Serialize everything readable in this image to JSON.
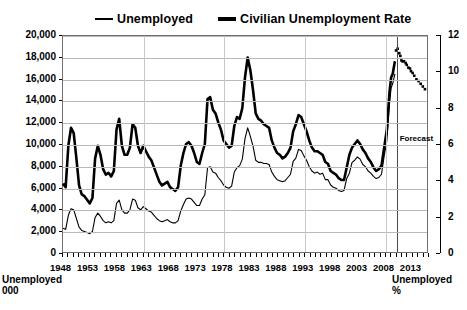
{
  "legend": {
    "items": [
      {
        "label": "Unemployed",
        "style": "thin-line",
        "x": 95
      },
      {
        "label": "Civilian Unemployment Rate",
        "style": "thick-line",
        "x": 218
      }
    ]
  },
  "annotations": {
    "forecast_label": "Forecast",
    "forecast_year": 2010
  },
  "axis_corner_labels": {
    "bottom_left_line1": "Unemployed",
    "bottom_left_line2": "000",
    "bottom_right_line1": "Unemployed",
    "bottom_right_line2": "%"
  },
  "chart_data": {
    "type": "line",
    "title": "",
    "xlabel": "",
    "ylabel": "Unemployed 000",
    "y2label": "Unemployed %",
    "grid": true,
    "legend_position": "top",
    "xlim": [
      1948,
      2016
    ],
    "ylim": [
      0,
      20000
    ],
    "y2lim": [
      0,
      12
    ],
    "yticks": [
      "0",
      "2,000",
      "4,000",
      "6,000",
      "8,000",
      "10,000",
      "12,000",
      "14,000",
      "16,000",
      "18,000",
      "20,000"
    ],
    "y2ticks": [
      "0",
      "2",
      "4",
      "6",
      "8",
      "10",
      "12"
    ],
    "xticks": [
      "1948",
      "1953",
      "1958",
      "1963",
      "1968",
      "1973",
      "1978",
      "1983",
      "1988",
      "1993",
      "1998",
      "2003",
      "2008",
      "2013"
    ],
    "series": [
      {
        "name": "Unemployed",
        "axis": "left",
        "units": "thousands",
        "stroke": "#000000",
        "width": 1.1,
        "x": [
          1948.0,
          1948.5,
          1949.0,
          1949.5,
          1950.0,
          1950.5,
          1951.0,
          1951.5,
          1952.0,
          1952.5,
          1953.0,
          1953.5,
          1954.0,
          1954.5,
          1955.0,
          1955.5,
          1956.0,
          1956.5,
          1957.0,
          1957.5,
          1958.0,
          1958.5,
          1959.0,
          1959.5,
          1960.0,
          1960.5,
          1961.0,
          1961.5,
          1962.0,
          1962.5,
          1963.0,
          1963.5,
          1964.0,
          1964.5,
          1965.0,
          1965.5,
          1966.0,
          1966.5,
          1967.0,
          1967.5,
          1968.0,
          1968.5,
          1969.0,
          1969.5,
          1970.0,
          1970.5,
          1971.0,
          1971.5,
          1972.0,
          1972.5,
          1973.0,
          1973.5,
          1974.0,
          1974.5,
          1975.0,
          1975.5,
          1976.0,
          1976.5,
          1977.0,
          1977.5,
          1978.0,
          1978.5,
          1979.0,
          1979.5,
          1980.0,
          1980.5,
          1981.0,
          1981.5,
          1982.0,
          1982.5,
          1983.0,
          1983.5,
          1984.0,
          1984.5,
          1985.0,
          1985.5,
          1986.0,
          1986.5,
          1987.0,
          1987.5,
          1988.0,
          1988.5,
          1989.0,
          1989.5,
          1990.0,
          1990.5,
          1991.0,
          1991.5,
          1992.0,
          1992.5,
          1993.0,
          1993.5,
          1994.0,
          1994.5,
          1995.0,
          1995.5,
          1996.0,
          1996.5,
          1997.0,
          1997.5,
          1998.0,
          1998.5,
          1999.0,
          1999.5,
          2000.0,
          2000.5,
          2001.0,
          2001.5,
          2002.0,
          2002.5,
          2003.0,
          2003.5,
          2004.0,
          2004.5,
          2005.0,
          2005.5,
          2006.0,
          2006.5,
          2007.0,
          2007.5,
          2008.0,
          2008.5,
          2009.0,
          2009.3,
          2009.6,
          2010.0
        ],
        "y": [
          2200,
          2100,
          3400,
          4000,
          3900,
          3100,
          2300,
          2000,
          1900,
          1800,
          1700,
          1900,
          3200,
          3600,
          3300,
          2900,
          2700,
          2800,
          2700,
          2900,
          4500,
          4800,
          3900,
          3600,
          3600,
          3900,
          4900,
          4800,
          4100,
          3900,
          4200,
          4000,
          3800,
          3700,
          3400,
          3100,
          2900,
          2800,
          2900,
          3000,
          2800,
          2700,
          2700,
          2900,
          3800,
          4400,
          4900,
          5000,
          4900,
          4600,
          4300,
          4300,
          4900,
          5300,
          7800,
          7900,
          7400,
          7300,
          6900,
          6600,
          6200,
          6000,
          5900,
          6100,
          7400,
          7800,
          8000,
          8600,
          10500,
          11500,
          10700,
          9800,
          8500,
          8300,
          8300,
          8200,
          8200,
          8100,
          7400,
          7000,
          6700,
          6600,
          6500,
          6600,
          6900,
          7200,
          8400,
          8700,
          9500,
          9400,
          8900,
          8500,
          7900,
          7500,
          7300,
          7400,
          7200,
          7300,
          6700,
          6700,
          6200,
          6000,
          5900,
          5700,
          5600,
          5700,
          6800,
          7300,
          8300,
          8500,
          8800,
          8600,
          8100,
          7900,
          7500,
          7300,
          7000,
          6800,
          6900,
          7200,
          8900,
          10300,
          13800,
          15200,
          15600,
          16500
        ]
      },
      {
        "name": "Civilian Unemployment Rate",
        "axis": "right",
        "units": "percent",
        "stroke": "#000000",
        "width": 2.6,
        "x": [
          1948.0,
          1948.5,
          1949.0,
          1949.5,
          1950.0,
          1950.5,
          1951.0,
          1951.5,
          1952.0,
          1952.5,
          1953.0,
          1953.5,
          1954.0,
          1954.5,
          1955.0,
          1955.5,
          1956.0,
          1956.5,
          1957.0,
          1957.5,
          1958.0,
          1958.5,
          1959.0,
          1959.5,
          1960.0,
          1960.5,
          1961.0,
          1961.5,
          1962.0,
          1962.5,
          1963.0,
          1963.5,
          1964.0,
          1964.5,
          1965.0,
          1965.5,
          1966.0,
          1966.5,
          1967.0,
          1967.5,
          1968.0,
          1968.5,
          1969.0,
          1969.5,
          1970.0,
          1970.5,
          1971.0,
          1971.5,
          1972.0,
          1972.5,
          1973.0,
          1973.5,
          1974.0,
          1974.5,
          1975.0,
          1975.5,
          1976.0,
          1976.5,
          1977.0,
          1977.5,
          1978.0,
          1978.5,
          1979.0,
          1979.5,
          1980.0,
          1980.5,
          1981.0,
          1981.5,
          1982.0,
          1982.5,
          1983.0,
          1983.5,
          1984.0,
          1984.5,
          1985.0,
          1985.5,
          1986.0,
          1986.5,
          1987.0,
          1987.5,
          1988.0,
          1988.5,
          1989.0,
          1989.5,
          1990.0,
          1990.5,
          1991.0,
          1991.5,
          1992.0,
          1992.5,
          1993.0,
          1993.5,
          1994.0,
          1994.5,
          1995.0,
          1995.5,
          1996.0,
          1996.5,
          1997.0,
          1997.5,
          1998.0,
          1998.5,
          1999.0,
          1999.5,
          2000.0,
          2000.5,
          2001.0,
          2001.5,
          2002.0,
          2002.5,
          2003.0,
          2003.5,
          2004.0,
          2004.5,
          2005.0,
          2005.5,
          2006.0,
          2006.5,
          2007.0,
          2007.5,
          2008.0,
          2008.5,
          2009.0,
          2009.3,
          2009.6,
          2010.0
        ],
        "y": [
          3.8,
          3.6,
          5.9,
          6.9,
          6.6,
          5.2,
          3.7,
          3.2,
          3.1,
          2.9,
          2.7,
          3.0,
          5.2,
          5.9,
          5.4,
          4.6,
          4.3,
          4.4,
          4.2,
          4.5,
          6.8,
          7.4,
          5.9,
          5.4,
          5.4,
          5.8,
          7.1,
          6.9,
          5.9,
          5.5,
          5.9,
          5.6,
          5.3,
          5.1,
          4.7,
          4.3,
          3.9,
          3.7,
          3.8,
          3.9,
          3.6,
          3.5,
          3.4,
          3.6,
          4.8,
          5.5,
          6.0,
          6.1,
          5.9,
          5.5,
          5.0,
          4.9,
          5.5,
          6.0,
          8.5,
          8.6,
          7.9,
          7.7,
          7.2,
          6.8,
          6.2,
          6.0,
          5.8,
          5.9,
          7.0,
          7.5,
          7.4,
          8.0,
          9.7,
          10.8,
          10.1,
          9.0,
          7.7,
          7.4,
          7.3,
          7.1,
          7.0,
          6.9,
          6.2,
          5.8,
          5.5,
          5.4,
          5.2,
          5.3,
          5.5,
          5.8,
          6.7,
          7.1,
          7.6,
          7.5,
          7.1,
          6.7,
          6.2,
          5.8,
          5.6,
          5.6,
          5.5,
          5.4,
          5.0,
          4.9,
          4.5,
          4.4,
          4.3,
          4.1,
          4.0,
          4.0,
          4.7,
          5.4,
          5.8,
          6.0,
          6.2,
          6.0,
          5.7,
          5.5,
          5.2,
          5.0,
          4.7,
          4.5,
          4.6,
          4.8,
          5.8,
          6.8,
          8.9,
          9.7,
          9.9,
          10.6
        ]
      },
      {
        "name": "Forecast",
        "axis": "right",
        "units": "percent",
        "marker": "square-dot",
        "stroke": "#000000",
        "x": [
          2010.2,
          2010.5,
          2010.8,
          2011.0,
          2011.2,
          2011.4,
          2011.7,
          2012.0,
          2012.2,
          2012.5,
          2012.8,
          2013.0,
          2013.3,
          2013.6,
          2014.0,
          2014.4,
          2014.8,
          2015.2,
          2015.6
        ],
        "y": [
          11.2,
          11.3,
          11.05,
          10.9,
          10.65,
          10.6,
          10.6,
          10.5,
          10.4,
          10.25,
          10.2,
          10.05,
          9.95,
          9.8,
          9.6,
          9.5,
          9.35,
          9.2,
          9.05
        ]
      }
    ]
  }
}
